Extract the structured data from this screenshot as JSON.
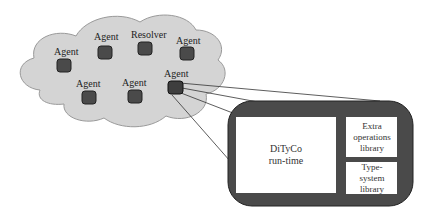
{
  "diagram": {
    "cloud": {
      "fill": "#d4d4d4",
      "stroke": "#9a9a9a",
      "nodes": [
        {
          "label": "Agent",
          "x": 56,
          "y": 63,
          "lx": 36,
          "ly": 53
        },
        {
          "label": "Agent",
          "x": 98,
          "y": 47,
          "lx": 96,
          "ly": 37
        },
        {
          "label": "Resolver",
          "x": 137,
          "y": 44,
          "lx": 131,
          "ly": 37
        },
        {
          "label": "Agent",
          "x": 181,
          "y": 49,
          "lx": 175,
          "ly": 42
        },
        {
          "label": "Agent",
          "x": 80,
          "y": 94,
          "lx": 76,
          "ly": 86
        },
        {
          "label": "Agent",
          "x": 127,
          "y": 94,
          "lx": 120,
          "ly": 85
        },
        {
          "label": "Agent",
          "x": 168,
          "y": 82,
          "lx": 162,
          "ly": 76
        }
      ],
      "node_fill": "#4a4a4a"
    },
    "zoom_container": {
      "fill": "#4a4a4a",
      "boxes": {
        "runtime": {
          "line1": "DiTyCo",
          "line2": "run-time"
        },
        "extra_ops": {
          "line1": "Extra",
          "line2": "operations",
          "line3": "library"
        },
        "type_system": {
          "line1": "Type-",
          "line2": "system",
          "line3": "library"
        }
      }
    }
  }
}
